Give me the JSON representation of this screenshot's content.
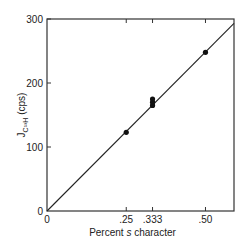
{
  "chart_data": {
    "type": "scatter",
    "title": "",
    "xlabel": "Percent s character",
    "ylabel": "J_C13H (cps)",
    "xlim": [
      0,
      0.59
    ],
    "ylim": [
      0,
      300
    ],
    "x_ticks": [
      0,
      0.25,
      0.333,
      0.5
    ],
    "x_tick_labels": [
      "0",
      ".25",
      ".333",
      ".50"
    ],
    "y_ticks": [
      0,
      100,
      200,
      300
    ],
    "y_tick_labels": [
      "0",
      "100",
      "200",
      "300"
    ],
    "grid": false,
    "legend": null,
    "series": [
      {
        "name": "data",
        "x": [
          0.25,
          0.333,
          0.333,
          0.333,
          0.5
        ],
        "y": [
          123,
          165,
          170,
          175,
          248
        ]
      }
    ],
    "fit_line": {
      "x": [
        0,
        0.59
      ],
      "y": [
        0,
        293
      ]
    }
  },
  "labels": {
    "xlabel": "Percent",
    "xlabel_italic": "s",
    "xlabel_rest": "character",
    "ylabel_main": "J",
    "ylabel_sub": "C¹³H",
    "ylabel_unit": "(cps)"
  }
}
